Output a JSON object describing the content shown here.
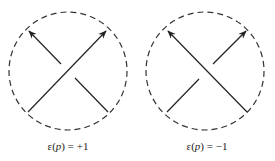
{
  "figure": {
    "panels": [
      {
        "label_prefix": "ε(",
        "label_var": "p",
        "label_suffix": ") = +1",
        "crossing": "positive"
      },
      {
        "label_prefix": "ε(",
        "label_var": "p",
        "label_suffix": ") = −1",
        "crossing": "negative"
      }
    ],
    "colors": {
      "stroke": "#222222",
      "circle": "#333333"
    }
  }
}
